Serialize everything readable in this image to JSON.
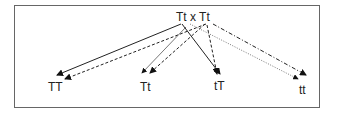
{
  "diagram": {
    "title": "Tt x Tt",
    "parent_cross": "Tt x Tt",
    "offspring": [
      "TT",
      "Tt",
      "tT",
      "tt"
    ],
    "arrows": [
      {
        "from": "T (parent 1)",
        "to": "TT",
        "style": "solid"
      },
      {
        "from": "T (parent 2)",
        "to": "TT",
        "style": "dashed"
      },
      {
        "from": "T (parent 1)",
        "to": "Tt",
        "style": "dotted"
      },
      {
        "from": "t (parent 2)",
        "to": "Tt",
        "style": "dashed"
      },
      {
        "from": "t (parent 1)",
        "to": "tT",
        "style": "solid"
      },
      {
        "from": "T (parent 2)",
        "to": "tT",
        "style": "dashed"
      },
      {
        "from": "t (parent 1)",
        "to": "tt",
        "style": "dotted"
      },
      {
        "from": "t (parent 2)",
        "to": "tt",
        "style": "dash-dot"
      }
    ],
    "colors": {
      "line": "#222222",
      "border": "#666666"
    }
  }
}
